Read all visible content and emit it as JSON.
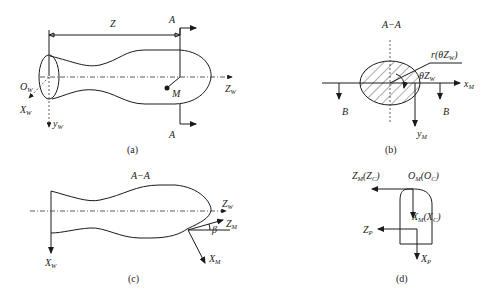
{
  "panels": {
    "a": {
      "caption": "(a)",
      "distance_label": "Z",
      "section_top": "A",
      "section_bottom": "A",
      "origin": "O",
      "origin_sub": "W",
      "x_axis": "X",
      "x_axis_sub": "W",
      "y_axis": "y",
      "y_axis_sub": "W",
      "z_axis": "Z",
      "z_axis_sub": "W",
      "point": "M"
    },
    "b": {
      "caption": "(b)",
      "title": "A−A",
      "radius_label": "r(θZ",
      "radius_sub": "W",
      "radius_close": ")",
      "angle_label": "θZ",
      "angle_sub": "W",
      "x_axis": "x",
      "x_axis_sub": "M",
      "y_axis": "y",
      "y_axis_sub": "M",
      "section_left": "B",
      "section_right": "B"
    },
    "c": {
      "caption": "(c)",
      "title": "A−A",
      "z_w": "Z",
      "z_w_sub": "W",
      "z_m": "Z",
      "z_m_sub": "M",
      "x_w": "X",
      "x_w_sub": "W",
      "x_m": "X",
      "x_m_sub": "M",
      "angle": "β"
    },
    "d": {
      "caption": "(d)",
      "z_m_label": "Z",
      "z_m_sub": "M",
      "z_m_paren": "(Z",
      "z_c_sub": "C",
      "close": ")",
      "o_m_label": "O",
      "o_m_sub": "M",
      "o_c_paren": "(O",
      "o_c_sub": "C",
      "x_m_label": "X",
      "x_m_sub": "M",
      "x_c_paren": "(X",
      "x_c_sub": "C",
      "z_p": "Z",
      "z_p_sub": "P",
      "x_p": "X",
      "x_p_sub": "P"
    }
  }
}
